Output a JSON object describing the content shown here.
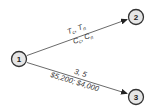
{
  "diagram": {
    "type": "network-activity-diagram",
    "nodes": [
      {
        "id": "1",
        "label": "1",
        "cx": 19,
        "cy": 59
      },
      {
        "id": "2",
        "label": "2",
        "cx": 136,
        "cy": 17
      },
      {
        "id": "3",
        "label": "3",
        "cx": 136,
        "cy": 97
      }
    ],
    "edges": [
      {
        "from": "1",
        "to": "2",
        "top_label": {
          "t1": "T",
          "t1_sub": "c",
          "sep": ", ",
          "t2": "T",
          "t2_sub": "n"
        },
        "bottom_label": {
          "t1": "C",
          "t1_sub": "c",
          "sep": ", ",
          "t2": "C",
          "t2_sub": "n"
        }
      },
      {
        "from": "1",
        "to": "3",
        "top_label": "3, 5",
        "bottom_label": "$5,200; $4,000"
      }
    ],
    "colors": {
      "node_fill": "#e6e6e6",
      "node_stroke": "#333333",
      "edge": "#444444",
      "text": "#333333"
    }
  }
}
